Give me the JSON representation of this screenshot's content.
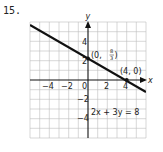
{
  "problem": {
    "number": "15."
  },
  "graph": {
    "axes": {
      "x_label": "x",
      "y_label": "y"
    },
    "x_ticks": [
      "−4",
      "−2",
      "0",
      "2",
      "4"
    ],
    "y_ticks": [
      "4",
      "2",
      "−2",
      "−4"
    ],
    "equation": "2x + 3y = 8",
    "points": [
      {
        "label_prefix": "(0, ",
        "frac_num": "8",
        "frac_den": "3",
        "label_suffix": ")"
      },
      {
        "label": "(4, 0)"
      }
    ]
  }
}
